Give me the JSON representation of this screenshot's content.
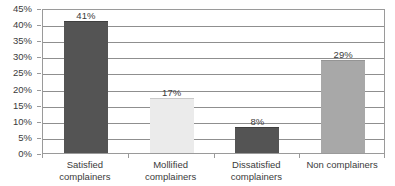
{
  "chart_data": {
    "type": "bar",
    "title": "",
    "subtitle": "",
    "xlabel": "",
    "ylabel": "",
    "categories": [
      "Satisfied complainers",
      "Mollified complainers",
      "Dissatisfied complainers",
      "Non complainers"
    ],
    "category_lines": [
      [
        "Satisfied",
        "complainers"
      ],
      [
        "Mollified",
        "complainers"
      ],
      [
        "Dissatisfied",
        "complainers"
      ],
      [
        "Non complainers"
      ]
    ],
    "values": [
      41,
      17,
      8,
      29
    ],
    "value_labels": [
      "41%",
      "17%",
      "8%",
      "29%"
    ],
    "bar_colors": [
      "#545454",
      "#ebebeb",
      "#545454",
      "#a8a8a8"
    ],
    "bar_border_colors": [
      "#3f3f3f",
      "#c9c9c9",
      "#3f3f3f",
      "#949494"
    ],
    "ylim": [
      0,
      45
    ],
    "ytick_values": [
      45,
      40,
      35,
      30,
      25,
      20,
      15,
      10,
      5,
      0
    ],
    "ytick_labels": [
      "45%",
      "40%",
      "35%",
      "30%",
      "25%",
      "20%",
      "15%",
      "10%",
      "5%",
      "0%"
    ],
    "grid": true,
    "grid_color": "#8f8f8f",
    "legend": "none",
    "axis_color": "#9a9a9a",
    "text_color": "#3b3b3b",
    "background": "#ffffff"
  }
}
